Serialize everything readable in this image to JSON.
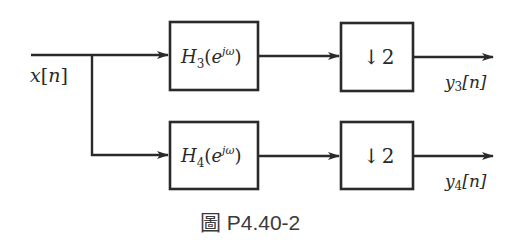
{
  "diagram": {
    "input": {
      "label": "x[n]",
      "var": "x",
      "index": "n"
    },
    "branches": [
      {
        "filter": {
          "label": "H3(e^{jω})",
          "base": "H",
          "sub": "3",
          "arg_open": "(e",
          "sup": "jω",
          "arg_close": ")"
        },
        "downsampler": {
          "label": "↓2",
          "arrow": "↓",
          "factor": "2"
        },
        "output": {
          "label": "y3[n]",
          "var": "y",
          "sub": "3",
          "index": "[n]"
        }
      },
      {
        "filter": {
          "label": "H4(e^{jω})",
          "base": "H",
          "sub": "4",
          "arg_open": "(e",
          "sup": "jω",
          "arg_close": ")"
        },
        "downsampler": {
          "label": "↓2",
          "arrow": "↓",
          "factor": "2"
        },
        "output": {
          "label": "y4[n]",
          "var": "y",
          "sub": "4",
          "index": "[n]"
        }
      }
    ]
  },
  "caption": {
    "icon": "圖",
    "text": "P4.40-2"
  },
  "colors": {
    "stroke": "#2a2a2a",
    "background": "#ffffff"
  }
}
